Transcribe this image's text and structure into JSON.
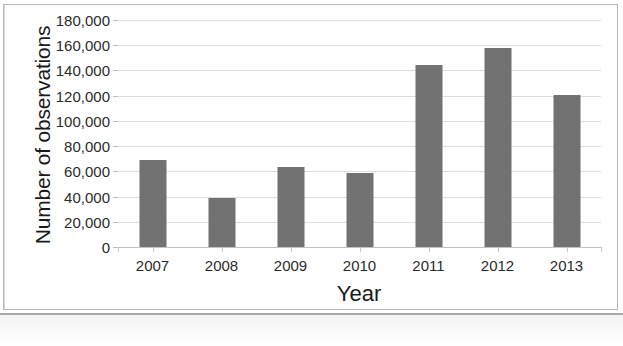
{
  "chart_data": {
    "type": "bar",
    "title": "",
    "xlabel": "Year",
    "ylabel": "Number of observations",
    "categories": [
      "2007",
      "2008",
      "2009",
      "2010",
      "2011",
      "2012",
      "2013"
    ],
    "values": [
      69000,
      38500,
      63500,
      59000,
      144000,
      158000,
      120500
    ],
    "ylim": [
      0,
      180000
    ],
    "ytick_values": [
      0,
      20000,
      40000,
      60000,
      80000,
      100000,
      120000,
      140000,
      160000,
      180000
    ],
    "ytick_labels": [
      "0",
      "20,000",
      "40,000",
      "60,000",
      "80,000",
      "100,000",
      "120,000",
      "140,000",
      "160,000",
      "180,000"
    ],
    "grid": true,
    "legend": false,
    "legend_position": "none",
    "bar_color": "#727272",
    "gridline_color": "#dcdcdc",
    "axis_color": "#c2c2c2",
    "background_color": "#ffffff"
  }
}
